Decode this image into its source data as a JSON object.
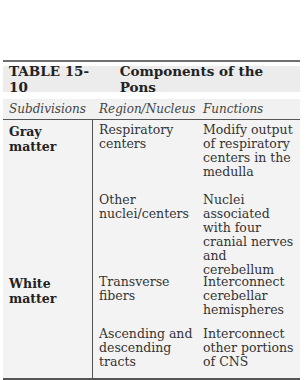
{
  "table": {
    "number": "TABLE 15-10",
    "title": "Components of the Pons",
    "headers": [
      "Subdivisions",
      "Region/Nucleus",
      "Functions"
    ],
    "groups": [
      {
        "subdivision": "Gray matter",
        "rows": [
          {
            "region": "Respiratory centers",
            "function": "Modify output of respiratory centers in the medulla"
          },
          {
            "region": "Other nuclei/centers",
            "function": "Nuclei associated with four cranial nerves and cerebellum"
          }
        ]
      },
      {
        "subdivision": "White matter",
        "rows": [
          {
            "region": "Transverse fibers",
            "function": "Interconnect cerebellar hemispheres"
          },
          {
            "region": "Ascending and descending tracts",
            "function": "Interconnect other portions of CNS"
          }
        ]
      }
    ]
  }
}
